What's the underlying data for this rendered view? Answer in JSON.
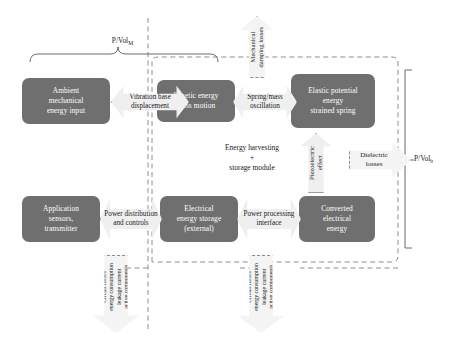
{
  "diagram": {
    "labels": {
      "pvol_mech": "P/Vol",
      "pvol_mech_sub": "M",
      "pvol_bat": "P/Vol",
      "pvol_bat_sub": "b",
      "harvesting_module_line1": "Energy harvesting",
      "harvesting_module_line2": "+",
      "harvesting_module_line3": "storage module"
    },
    "top_row": {
      "boxes": [
        {
          "id": "ambient-mechanical-energy-input",
          "lines": [
            "Ambient",
            "mechanical",
            "energy input"
          ]
        },
        {
          "id": "kinetic-energy-mass-motion",
          "lines": [
            "Kinetic energy",
            "mass motion"
          ]
        },
        {
          "id": "elastic-potential-energy-strained-spring",
          "lines": [
            "Elastic potential",
            "energy",
            "strained spring"
          ]
        }
      ],
      "arrows": [
        {
          "id": "vibration-base-displacement",
          "lines": [
            "Vibration",
            "base displacement"
          ]
        },
        {
          "id": "spring-mass-oscillation",
          "lines": [
            "Spring/mass",
            "oscillation"
          ]
        }
      ]
    },
    "bottom_row": {
      "boxes": [
        {
          "id": "application-sensors-transmitter",
          "lines": [
            "Application",
            "sensors,",
            "transmitter"
          ]
        },
        {
          "id": "electrical-energy-storage-external",
          "lines": [
            "Electrical",
            "energy storage",
            "(external)"
          ]
        },
        {
          "id": "converted-electrical-energy",
          "lines": [
            "Converted",
            "electrical",
            "energy"
          ]
        }
      ],
      "arrows": [
        {
          "id": "power-distribution-and-controls",
          "lines": [
            "Power",
            "distribution",
            "and controls"
          ]
        },
        {
          "id": "power-processing-interface",
          "lines": [
            "Power",
            "processing",
            "interface"
          ]
        }
      ]
    },
    "coupling_arrows": [
      {
        "id": "piezoelectric-effect",
        "text": "Piezoelectric\neffect"
      }
    ],
    "loss_arrows": [
      {
        "id": "mechanical-damping-losses",
        "text": "Mechanical\ndamping losses"
      },
      {
        "id": "dielectric-losses",
        "lines": [
          "Dielectric",
          "losses"
        ]
      },
      {
        "id": "circuit-losses-left",
        "text": "Circuit losses\nenergy consumption\nleakage current\nactive components"
      },
      {
        "id": "circuit-losses-right",
        "text": "Circuit losses\nenergy consumption\nleakage current\nactive components"
      }
    ],
    "colors": {
      "box_fill": "#6f6f6f",
      "box_text": "#ffffff",
      "arrow_fill": "#efefef",
      "arrow_stroke": "#9a9a9a",
      "dashed_stroke": "#8d8d8d",
      "background": "#ffffff"
    }
  }
}
